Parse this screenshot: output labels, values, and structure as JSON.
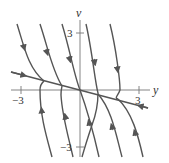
{
  "diagram": {
    "type": "phase-plane",
    "colors": {
      "curve": "#555555",
      "axis": "#777777",
      "text": "#333333"
    },
    "axes": {
      "horizontal_label": "y",
      "vertical_label": "v",
      "ticks": {
        "h_neg": "−3",
        "h_pos": "3",
        "v_pos": "3",
        "v_neg": "−3"
      }
    },
    "straight_line": {
      "description": "straight-line solution through origin with arrows pointing toward origin"
    },
    "trajectories_top": 5,
    "trajectories_bottom": 5
  }
}
